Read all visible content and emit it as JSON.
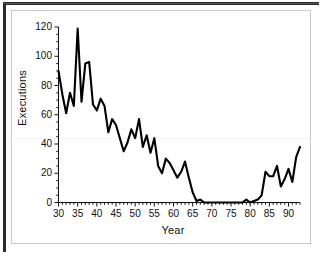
{
  "figure": {
    "background_color": "#ffffff",
    "line_color": "#000000",
    "frame_color": "#2b2b2b",
    "inner_frame_color": "#c9c9c9"
  },
  "chart_data": {
    "type": "line",
    "title": "",
    "xlabel": "Year",
    "ylabel": "Executions",
    "xlim": [
      30,
      93
    ],
    "ylim": [
      0,
      120
    ],
    "grid": false,
    "legend": null,
    "x_ticks": [
      30,
      35,
      40,
      45,
      50,
      55,
      60,
      65,
      70,
      75,
      80,
      85,
      90
    ],
    "x_tick_labels": [
      "30",
      "35",
      "40",
      "45",
      "50",
      "55",
      "60",
      "65",
      "70",
      "75",
      "80",
      "85",
      "90"
    ],
    "x_minor_tick_interval": 1,
    "y_ticks": [
      0,
      20,
      40,
      60,
      80,
      100,
      120
    ],
    "y_tick_labels": [
      "0",
      "20",
      "40",
      "60",
      "80",
      "100",
      "120"
    ],
    "y_minor_tick_interval": 5,
    "series": [
      {
        "name": "Executions",
        "x": [
          30,
          31,
          32,
          33,
          34,
          35,
          36,
          37,
          38,
          39,
          40,
          41,
          42,
          43,
          44,
          45,
          46,
          47,
          48,
          49,
          50,
          51,
          52,
          53,
          54,
          55,
          56,
          57,
          58,
          59,
          60,
          61,
          62,
          63,
          64,
          65,
          66,
          67,
          68,
          69,
          70,
          71,
          72,
          73,
          74,
          75,
          76,
          77,
          78,
          79,
          80,
          81,
          82,
          83,
          84,
          85,
          86,
          87,
          88,
          89,
          90,
          91,
          92,
          93
        ],
        "y": [
          90,
          74,
          61,
          75,
          66,
          119,
          69,
          95,
          96,
          67,
          63,
          71,
          66,
          48,
          57,
          53,
          44,
          35,
          41,
          50,
          44,
          57,
          38,
          46,
          34,
          44,
          25,
          20,
          30,
          27,
          22,
          17,
          21,
          28,
          17,
          7,
          1,
          2,
          0,
          0,
          0,
          0,
          0,
          0,
          0,
          0,
          0,
          0,
          0,
          2,
          0,
          1,
          2,
          5,
          21,
          18,
          18,
          25,
          11,
          16,
          23,
          14,
          31,
          38
        ]
      }
    ],
    "note": "Counts of executions in the United States by year, 1930-1993"
  }
}
